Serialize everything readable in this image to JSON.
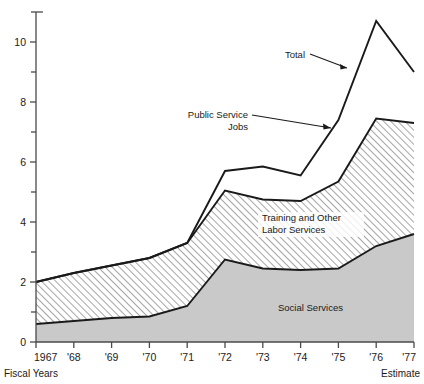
{
  "chart_data": {
    "type": "area",
    "title": "",
    "subtitle": "",
    "xlabel": "Fiscal Years",
    "ylabel": "",
    "x": [
      1967,
      1968,
      1969,
      1970,
      1971,
      1972,
      1973,
      1974,
      1975,
      1976,
      1977
    ],
    "categories": [
      "1967",
      "'68",
      "'69",
      "'70",
      "'71",
      "'72",
      "'73",
      "'74",
      "'75",
      "'76",
      "'77"
    ],
    "xlim": [
      1967,
      1977
    ],
    "ylim": [
      0,
      11
    ],
    "y_ticks_major": [
      0,
      2,
      4,
      6,
      8,
      10
    ],
    "y_ticks_minor": [
      1,
      3,
      5,
      7,
      9,
      11
    ],
    "grid": false,
    "legend_position": "inline-annotations",
    "stacked": true,
    "series": [
      {
        "name": "Social Services",
        "fill": "#c9c9c9",
        "pattern": "solid-gray",
        "values": [
          0.6,
          0.7,
          0.8,
          0.85,
          1.2,
          2.75,
          2.45,
          2.4,
          2.45,
          3.2,
          3.6
        ]
      },
      {
        "name": "Training and Other Labor Services",
        "fill": "#ffffff",
        "pattern": "diagonal-hatch",
        "values": [
          1.4,
          1.6,
          1.75,
          1.95,
          2.1,
          2.3,
          2.3,
          2.3,
          2.9,
          4.25,
          3.7
        ],
        "cumulative": [
          2.0,
          2.3,
          2.55,
          2.8,
          3.3,
          5.05,
          4.75,
          4.7,
          5.35,
          7.45,
          7.3
        ]
      },
      {
        "name": "Public Service Jobs",
        "fill": "#ffffff",
        "pattern": "none",
        "values": [
          0.0,
          0.0,
          0.0,
          0.0,
          0.0,
          0.65,
          1.1,
          0.85,
          2.05,
          3.25,
          1.7
        ],
        "cumulative": [
          2.0,
          2.3,
          2.55,
          2.8,
          3.3,
          5.7,
          5.85,
          5.55,
          7.4,
          10.7,
          9.0
        ]
      }
    ],
    "total": {
      "name": "Total",
      "values": [
        2.0,
        2.3,
        2.55,
        2.8,
        3.3,
        5.7,
        5.85,
        5.55,
        7.4,
        10.7,
        9.0
      ]
    },
    "annotations": [
      {
        "id": "total",
        "label": "Total",
        "x_px": 305,
        "y_px": 58
      },
      {
        "id": "public-service-jobs",
        "label_line1": "Public Service",
        "label_line2": "Jobs",
        "x_px": 248,
        "y_px": 118
      },
      {
        "id": "training-labor",
        "label_line1": "Training and Other",
        "label_line2": "Labor Services",
        "x_px": 262,
        "y_px": 222
      },
      {
        "id": "social-services",
        "label": "Social Services",
        "x_px": 278,
        "y_px": 311
      }
    ],
    "corner_labels": {
      "bottom_left": "Fiscal Years",
      "bottom_right": "Estimate"
    },
    "colors": {
      "social_services_fill": "#c9c9c9",
      "hatch_stroke": "#9a9a9a",
      "line": "#1a1a1a",
      "axis": "#4a4a4a",
      "text": "#1a1a1a",
      "background": "#ffffff"
    }
  }
}
